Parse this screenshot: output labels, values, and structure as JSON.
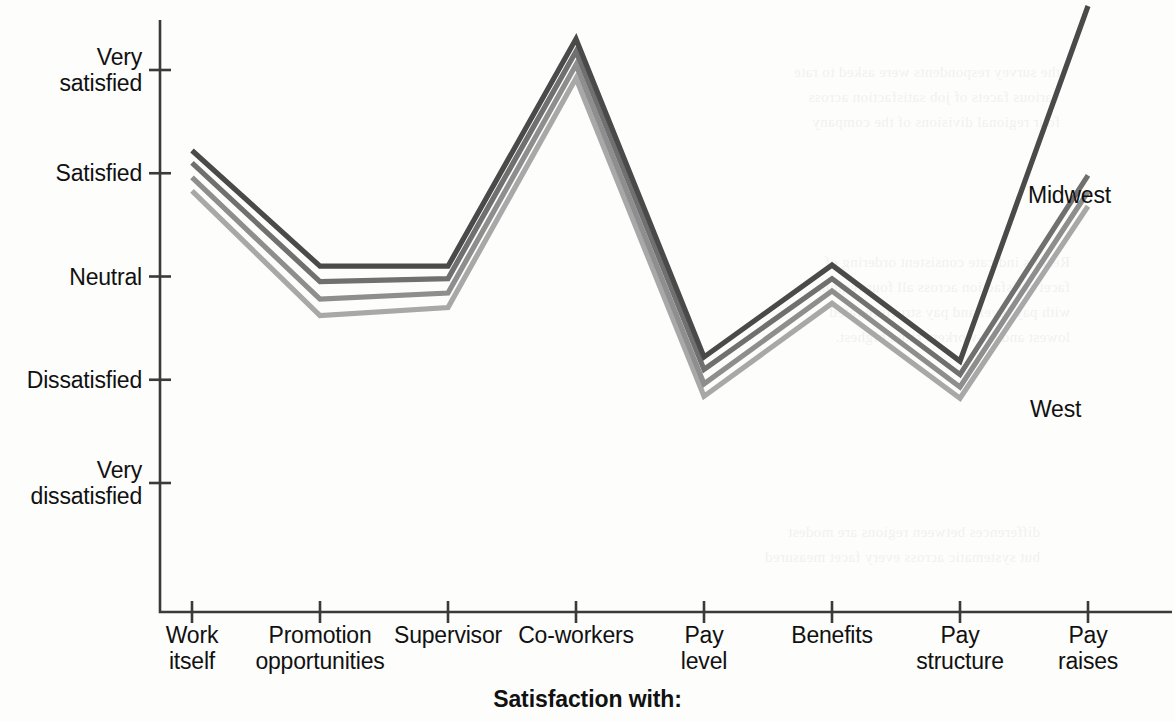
{
  "chart_data": {
    "type": "line",
    "title": "Satisfaction with:",
    "xlabel": "Satisfaction with:",
    "ylabel": "",
    "grid": false,
    "legend_position": "inline-right",
    "categories": [
      "Work itself",
      "Promotion opportunities",
      "Supervisor",
      "Co-workers",
      "Pay level",
      "Benefits",
      "Pay structure",
      "Pay raises"
    ],
    "category_lines": [
      [
        "Work",
        "itself"
      ],
      [
        "Promotion",
        "opportunities"
      ],
      [
        "Supervisor",
        ""
      ],
      [
        "Co-workers",
        ""
      ],
      [
        "Pay",
        "level"
      ],
      [
        "Benefits",
        ""
      ],
      [
        "Pay",
        "structure"
      ],
      [
        "Pay",
        "raises"
      ]
    ],
    "y_ticks": [
      {
        "label": "Very\nsatisfied",
        "value": 5
      },
      {
        "label": "Satisfied",
        "value": 4
      },
      {
        "label": "Neutral",
        "value": 3
      },
      {
        "label": "Dissatisfied",
        "value": 2
      },
      {
        "label": "Very\ndissatisfied",
        "value": 1
      }
    ],
    "ylim": [
      1,
      5
    ],
    "series": [
      {
        "name": "Midwest",
        "color": "#4a4a4a",
        "values": [
          4.22,
          3.1,
          3.1,
          5.3,
          2.22,
          3.11,
          2.18,
          5.62
        ]
      },
      {
        "name": "Region 2",
        "color": "#707070",
        "values": [
          4.1,
          2.95,
          2.98,
          5.18,
          2.1,
          2.98,
          2.05,
          3.98
        ]
      },
      {
        "name": "Region 3",
        "color": "#8e8e8e",
        "values": [
          3.96,
          2.78,
          2.84,
          5.05,
          1.96,
          2.86,
          1.93,
          3.82
        ]
      },
      {
        "name": "West",
        "color": "#a8a8a8",
        "values": [
          3.83,
          2.62,
          2.7,
          4.92,
          1.84,
          2.74,
          1.82,
          3.68
        ]
      }
    ],
    "series_labels": [
      {
        "name": "Midwest",
        "x": 1028,
        "y": 182
      },
      {
        "name": "West",
        "x": 1030,
        "y": 396
      }
    ],
    "colors": {
      "axis": "#3a3a3a",
      "text": "#111111",
      "background": "#fdfdfc"
    }
  },
  "ghost_text": {
    "block_a": "the survey respondents were asked to rate\nvarious facets of job satisfaction across\nfour regional divisions of the company",
    "block_b": "Results indicate consistent ordering of\nfacet satisfaction across all four regions,\nwith pay level and pay structure rated\nlowest and co-workers rated highest.",
    "block_c": "differences between regions are modest\nbut systematic across every facet measured"
  }
}
